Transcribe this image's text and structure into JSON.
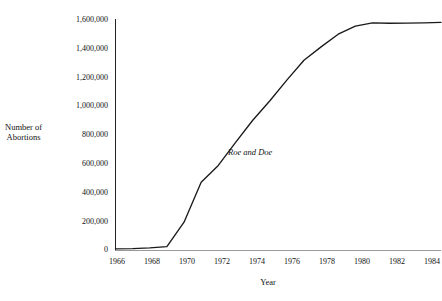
{
  "chart_data": {
    "type": "line",
    "title": "",
    "xlabel": "Year",
    "ylabel": "Number of\nAbortions",
    "ylabel_line1": "Number of",
    "ylabel_line2": "Abortions",
    "xlim": [
      1966,
      1985
    ],
    "ylim": [
      0,
      1600000
    ],
    "grid": false,
    "legend": "none",
    "line_color": "#1a1a1a",
    "xticks": [
      1966,
      1968,
      1970,
      1972,
      1974,
      1976,
      1978,
      1980,
      1982,
      1984
    ],
    "xtick_labels": [
      "1966",
      "1968",
      "1970",
      "1972",
      "1974",
      "1976",
      "1978",
      "1980",
      "1982",
      "1984"
    ],
    "yticks": [
      0,
      200000,
      400000,
      600000,
      800000,
      1000000,
      1200000,
      1400000,
      1600000
    ],
    "ytick_labels": [
      "0",
      "200,000",
      "400,000",
      "600,000",
      "800,000",
      "1,000,000",
      "1,200,000",
      "1,400,000",
      "1,600,000"
    ],
    "series": [
      {
        "name": "Number of Abortions",
        "x": [
          1966,
          1967,
          1968,
          1969,
          1970,
          1971,
          1972,
          1973,
          1974,
          1975,
          1976,
          1977,
          1978,
          1979,
          1980,
          1981,
          1982,
          1983,
          1984,
          1985
        ],
        "values": [
          8000,
          10000,
          15000,
          23000,
          193000,
          470000,
          587000,
          745000,
          899000,
          1034000,
          1179000,
          1317000,
          1410000,
          1498000,
          1554000,
          1577000,
          1574000,
          1575000,
          1577000,
          1580000
        ]
      }
    ],
    "annotations": [
      {
        "text": "Roe and Doe",
        "x": 1973,
        "y": 660000,
        "style": "italic"
      }
    ]
  }
}
